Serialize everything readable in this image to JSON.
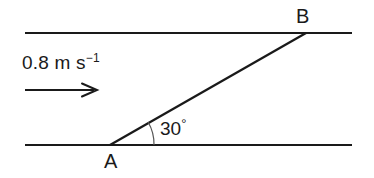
{
  "diagram": {
    "background_color": "#ffffff",
    "stroke_color": "#1a1a1a",
    "labels": {
      "velocity_value": "0.8 m s",
      "velocity_exponent": "−1",
      "angle_value": "30",
      "angle_degree_symbol": "°",
      "point_a": "A",
      "point_b": "B"
    },
    "geometry": {
      "top_line": {
        "x1": 25,
        "y1": 33,
        "x2": 352,
        "y2": 33
      },
      "bottom_line": {
        "x1": 25,
        "y1": 145,
        "x2": 352,
        "y2": 145
      },
      "diagonal_line": {
        "x1": 110,
        "y1": 145,
        "x2": 306,
        "y2": 33
      },
      "velocity_arrow": {
        "x1": 25,
        "y1": 90,
        "x2": 97,
        "y2": 90
      },
      "angle_arc": {
        "cx": 110,
        "cy": 145,
        "radius": 44,
        "start_deg": 0,
        "end_deg": 30
      },
      "point_a": {
        "x": 110,
        "y": 145
      },
      "point_b": {
        "x": 306,
        "y": 33
      }
    }
  }
}
